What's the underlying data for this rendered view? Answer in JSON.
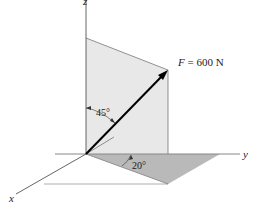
{
  "diagram": {
    "force_label": "F = 600 N",
    "force_var": "F",
    "force_rest": " = 600 N",
    "angle_z": "45°",
    "angle_xy": "20°",
    "axes": {
      "x": "x",
      "y": "y",
      "z": "z"
    },
    "colors": {
      "vertical_plane": "#e6e6e6",
      "horizontal_triangle": "#b8b8b8",
      "axis_line": "#555555",
      "force_arrow": "#000000"
    }
  }
}
